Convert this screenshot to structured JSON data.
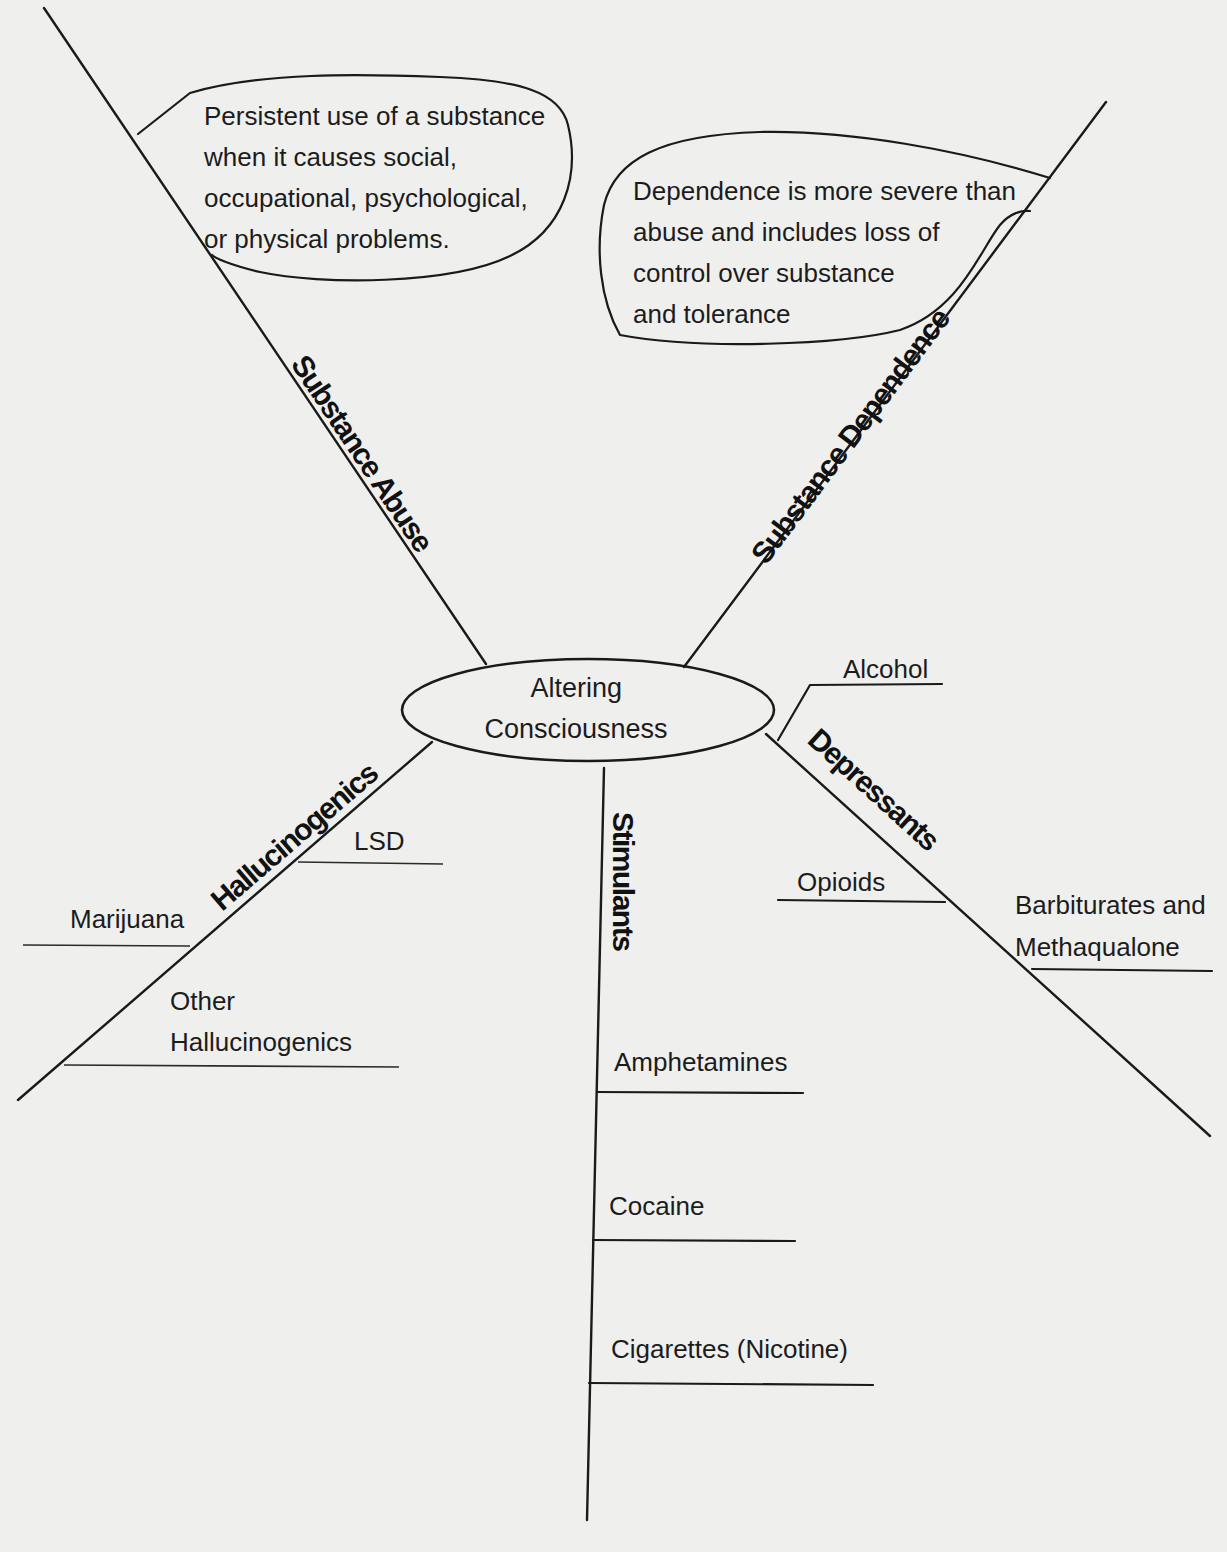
{
  "center": {
    "line1": "Altering",
    "line2": "Consciousness"
  },
  "branches": {
    "substance_abuse": {
      "label": "Substance Abuse",
      "callout": [
        "Persistent use of a substance",
        "when it causes social,",
        "occupational, psychological,",
        "or physical problems."
      ]
    },
    "substance_dependence": {
      "label": "Substance Dependence",
      "callout": [
        "Dependence is more severe than",
        "abuse and includes loss of",
        "control over substance",
        "and tolerance"
      ]
    },
    "hallucinogenics": {
      "label": "Hallucinogenics",
      "items": [
        {
          "lines": [
            "LSD"
          ]
        },
        {
          "lines": [
            "Marijuana"
          ]
        },
        {
          "lines": [
            "Other",
            "Hallucinogenics"
          ]
        }
      ]
    },
    "stimulants": {
      "label": "Stimulants",
      "items": [
        {
          "lines": [
            "Amphetamines"
          ]
        },
        {
          "lines": [
            "Cocaine"
          ]
        },
        {
          "lines": [
            "Cigarettes (Nicotine)"
          ]
        }
      ]
    },
    "depressants": {
      "label": "Depressants",
      "items": [
        {
          "lines": [
            "Alcohol"
          ]
        },
        {
          "lines": [
            "Opioids"
          ]
        },
        {
          "lines": [
            "Barbiturates and",
            "Methaqualone"
          ]
        }
      ]
    }
  },
  "colors": {
    "background": "#efefed",
    "ink": "#1a1a1a"
  }
}
